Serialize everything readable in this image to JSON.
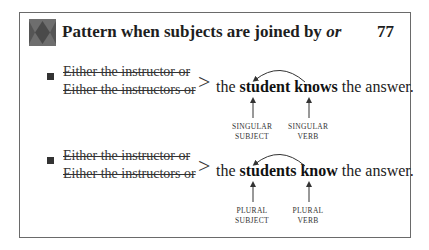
{
  "header": {
    "title_main": "Pattern when subjects are joined by ",
    "title_italic": "or",
    "page_number": "77",
    "icon": "diamond-pattern-icon"
  },
  "examples": [
    {
      "struck_lines": [
        "Either the instructor or",
        "Either the instructors or"
      ],
      "connector": ">",
      "sentence": {
        "pre": "the ",
        "subject": "student",
        "verb": "knows",
        "post": " the answer."
      },
      "labels": {
        "subject": [
          "SINGULAR",
          "SUBJECT"
        ],
        "verb": [
          "SINGULAR",
          "VERB"
        ]
      }
    },
    {
      "struck_lines": [
        "Either the instructor or",
        "Either the instructors or"
      ],
      "connector": ">",
      "sentence": {
        "pre": "the ",
        "subject": "students",
        "verb": "know",
        "post": " the answer."
      },
      "labels": {
        "subject": [
          "PLURAL",
          "SUBJECT"
        ],
        "verb": [
          "PLURAL",
          "VERB"
        ]
      }
    }
  ]
}
